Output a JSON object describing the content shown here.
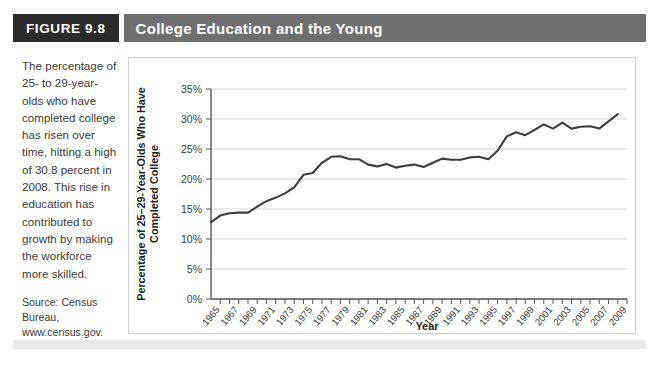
{
  "figure": {
    "tag": "FIGURE 9.8",
    "title": "College Education and the Young"
  },
  "caption": {
    "body": "The percentage of 25- to 29-year-olds who have completed college has risen over time, hitting a high of 30.8 percent in 2008. This rise in education has contributed to growth by making the workforce more skilled.",
    "source": "Source: Census Bureau, www.census.gov."
  },
  "colors": {
    "header_tag_bg": "#2b2b2b",
    "header_title_bg": "#6f6f6f",
    "header_text": "#ffffff",
    "line": "#3d3d3d",
    "grid": "#d4d4d4",
    "axis": "#555555",
    "panel_bg": "#ffffff",
    "caption_text": "#3a3a3a"
  },
  "chart_data": {
    "type": "line",
    "title": "College Education and the Young",
    "xlabel": "Year",
    "ylabel": "Percentage of 25–29-Year-Olds Who Have Completed College",
    "xlim": [
      1964,
      2009
    ],
    "ylim": [
      0,
      35
    ],
    "grid": true,
    "legend": "none",
    "ytick_labels": [
      "0%",
      "5%",
      "10%",
      "15%",
      "20%",
      "25%",
      "30%",
      "35%"
    ],
    "ytick_values": [
      0,
      5,
      10,
      15,
      20,
      25,
      30,
      35
    ],
    "xtick_labels": [
      "1965",
      "1967",
      "1969",
      "1971",
      "1973",
      "1975",
      "1977",
      "1979",
      "1981",
      "1983",
      "1985",
      "1987",
      "1989",
      "1991",
      "1993",
      "1995",
      "1997",
      "1999",
      "2001",
      "2003",
      "2005",
      "2007",
      "2009"
    ],
    "xtick_values": [
      1965,
      1967,
      1969,
      1971,
      1973,
      1975,
      1977,
      1979,
      1981,
      1983,
      1985,
      1987,
      1989,
      1991,
      1993,
      1995,
      1997,
      1999,
      2001,
      2003,
      2005,
      2007,
      2009
    ],
    "series": [
      {
        "name": "Percentage of 25-29-year-olds who have completed college",
        "x": [
          1964,
          1965,
          1966,
          1967,
          1968,
          1969,
          1970,
          1971,
          1972,
          1973,
          1974,
          1975,
          1976,
          1977,
          1978,
          1979,
          1980,
          1981,
          1982,
          1983,
          1984,
          1985,
          1986,
          1987,
          1988,
          1989,
          1990,
          1991,
          1992,
          1993,
          1994,
          1995,
          1996,
          1997,
          1998,
          1999,
          2000,
          2001,
          2002,
          2003,
          2004,
          2005,
          2006,
          2007,
          2008
        ],
        "values": [
          12.8,
          13.9,
          14.3,
          14.4,
          14.4,
          15.4,
          16.3,
          16.9,
          17.6,
          18.6,
          20.7,
          21.0,
          22.7,
          23.7,
          23.8,
          23.3,
          23.3,
          22.4,
          22.1,
          22.5,
          21.9,
          22.2,
          22.4,
          22.0,
          22.7,
          23.4,
          23.2,
          23.2,
          23.6,
          23.7,
          23.3,
          24.7,
          27.1,
          27.8,
          27.3,
          28.2,
          29.1,
          28.4,
          29.4,
          28.4,
          28.7,
          28.8,
          28.4,
          29.6,
          30.8
        ]
      }
    ],
    "annotations": [
      {
        "label": "high",
        "year": 2008,
        "value": 30.8
      }
    ]
  }
}
